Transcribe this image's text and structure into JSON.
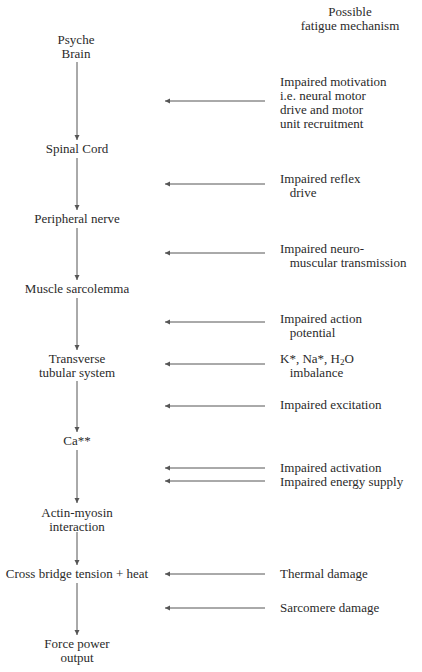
{
  "header": {
    "mechanism_column_title": "Possible\nfatigue mechanism"
  },
  "chain": {
    "nodes": [
      {
        "id": "psyche-brain",
        "label": "Psyche\nBrain"
      },
      {
        "id": "spinal-cord",
        "label": "Spinal Cord"
      },
      {
        "id": "peripheral-nerve",
        "label": "Peripheral nerve"
      },
      {
        "id": "muscle-sarcolemma",
        "label": "Muscle sarcolemma"
      },
      {
        "id": "transverse-tubular-system",
        "label": "Transverse\ntubular system"
      },
      {
        "id": "calcium",
        "label": "Ca**"
      },
      {
        "id": "actin-myosin",
        "label": "Actin-myosin\ninteraction"
      },
      {
        "id": "cross-bridge",
        "label": "Cross bridge tension + heat"
      },
      {
        "id": "force-power",
        "label": "Force power\noutput"
      }
    ]
  },
  "mechanisms": [
    {
      "id": "impaired-motivation",
      "label": "Impaired motivation\ni.e. neural motor\ndrive and motor\nunit recruitment"
    },
    {
      "id": "impaired-reflex",
      "label": "Impaired reflex\n   drive"
    },
    {
      "id": "impaired-neuromuscular",
      "label": "Impaired neuro-\n   muscular transmission"
    },
    {
      "id": "impaired-action-potential",
      "label": "Impaired action\n   potential"
    },
    {
      "id": "ion-imbalance",
      "label_pre": "K*, Na*, H",
      "label_sub": "2",
      "label_post": "O",
      "label_line2": "   imbalance"
    },
    {
      "id": "impaired-excitation",
      "label": "Impaired excitation"
    },
    {
      "id": "impaired-activation",
      "label": "Impaired activation"
    },
    {
      "id": "impaired-energy",
      "label": "Impaired energy supply"
    },
    {
      "id": "thermal-damage",
      "label": "Thermal damage"
    },
    {
      "id": "sarcomere-damage",
      "label": "Sarcomere damage"
    }
  ],
  "colors": {
    "text": "#2a2a2a",
    "lines": "#555555",
    "background": "#ffffff"
  }
}
